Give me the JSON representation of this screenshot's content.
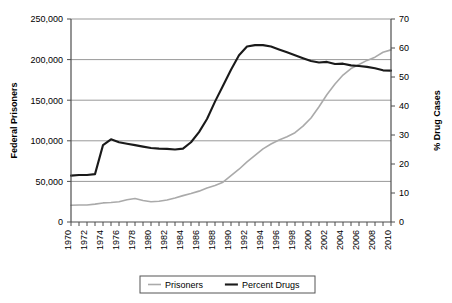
{
  "chart_data": {
    "type": "line",
    "title": "",
    "xlabel": "",
    "ylabel": "Federal Prisoners",
    "y2label": "% Drug Cases",
    "grid": true,
    "legend_position": "bottom",
    "xlim": [
      1970,
      2010
    ],
    "ylim": [
      0,
      250000
    ],
    "y2lim": [
      0,
      70
    ],
    "x": [
      1970,
      1971,
      1972,
      1973,
      1974,
      1975,
      1976,
      1977,
      1978,
      1979,
      1980,
      1981,
      1982,
      1983,
      1984,
      1985,
      1986,
      1987,
      1988,
      1989,
      1990,
      1991,
      1992,
      1993,
      1994,
      1995,
      1996,
      1997,
      1998,
      1999,
      2000,
      2001,
      2002,
      2003,
      2004,
      2005,
      2006,
      2007,
      2008,
      2009,
      2010
    ],
    "xtick_labels": [
      "1970",
      "1972",
      "1974",
      "1976",
      "1978",
      "1980",
      "1982",
      "1984",
      "1986",
      "1988",
      "1990",
      "1992",
      "1994",
      "1996",
      "1998",
      "2000",
      "2002",
      "2004",
      "2006",
      "2008",
      "2010"
    ],
    "ytick_labels": [
      "0",
      "50,000",
      "100,000",
      "150,000",
      "200,000",
      "250,000"
    ],
    "ytick_values": [
      0,
      50000,
      100000,
      150000,
      200000,
      250000
    ],
    "y2tick_labels": [
      "0",
      "10",
      "20",
      "30",
      "40",
      "50",
      "60",
      "70"
    ],
    "y2tick_values": [
      0,
      10,
      20,
      30,
      40,
      50,
      60,
      70
    ],
    "series": [
      {
        "name": "Prisoners",
        "axis": "left",
        "color": "#aaaaaa",
        "values": [
          20700,
          20900,
          21000,
          22000,
          23500,
          24000,
          25000,
          27500,
          29000,
          26500,
          25000,
          25500,
          27000,
          29500,
          32500,
          35000,
          38000,
          42000,
          45000,
          49000,
          57000,
          65000,
          74000,
          82000,
          90000,
          96000,
          101000,
          105000,
          110000,
          118000,
          128000,
          142000,
          157000,
          170000,
          181000,
          189000,
          194000,
          199000,
          203000,
          209000,
          212000
        ]
      },
      {
        "name": "Percent Drugs",
        "axis": "right",
        "color": "#1a1a1a",
        "values": [
          16.0,
          16.2,
          16.2,
          16.5,
          26.5,
          28.5,
          27.5,
          27.0,
          26.5,
          26.0,
          25.5,
          25.3,
          25.2,
          25.0,
          25.3,
          27.5,
          31.0,
          35.5,
          41.5,
          47.0,
          52.5,
          57.5,
          60.5,
          61.0,
          61.0,
          60.5,
          59.5,
          58.5,
          57.5,
          56.5,
          55.5,
          55.0,
          55.2,
          54.5,
          54.6,
          54.0,
          53.8,
          53.5,
          53.0,
          52.3,
          52.2
        ]
      }
    ]
  },
  "legend": {
    "items": [
      {
        "label": "Prisoners",
        "color": "#aaaaaa"
      },
      {
        "label": "Percent Drugs",
        "color": "#1a1a1a"
      }
    ]
  }
}
